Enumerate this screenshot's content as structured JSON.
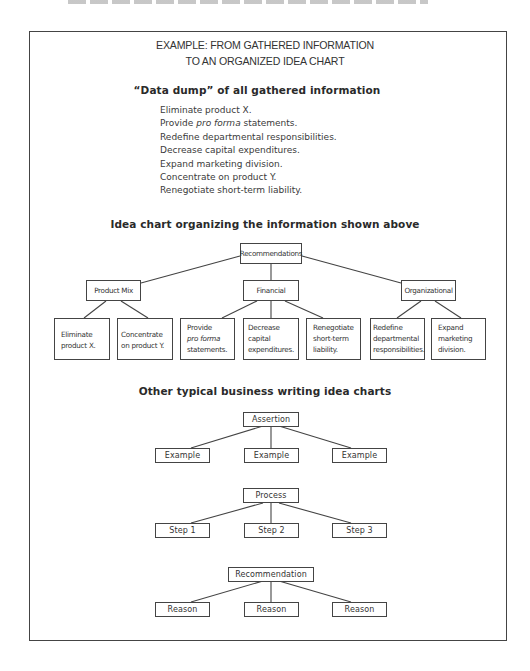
{
  "frame_title": {
    "line1": "EXAMPLE:  FROM GATHERED INFORMATION",
    "line2": "TO AN ORGANIZED IDEA CHART"
  },
  "data_dump": {
    "heading": "“Data dump” of all gathered information",
    "items": [
      {
        "pre": "Eliminate product X.",
        "italic": "",
        "post": ""
      },
      {
        "pre": "Provide ",
        "italic": "pro forma",
        "post": " statements."
      },
      {
        "pre": "Redefine departmental responsibilities.",
        "italic": "",
        "post": ""
      },
      {
        "pre": "Decrease capital expenditures.",
        "italic": "",
        "post": ""
      },
      {
        "pre": "Expand marketing division.",
        "italic": "",
        "post": ""
      },
      {
        "pre": "Concentrate on product Y.",
        "italic": "",
        "post": ""
      },
      {
        "pre": "Renegotiate short-term liability.",
        "italic": "",
        "post": ""
      }
    ]
  },
  "idea_chart": {
    "heading": "Idea chart organizing the information shown above",
    "root": "Recommendations",
    "branches": [
      {
        "label": "Product Mix",
        "leaves": [
          {
            "lines": [
              "Eliminate",
              "product X."
            ]
          },
          {
            "lines": [
              "Concentrate",
              "on product Y."
            ]
          }
        ]
      },
      {
        "label": "Financial",
        "leaves": [
          {
            "lines": [
              "Provide",
              "pro forma",
              "statements."
            ],
            "italic_line": 1
          },
          {
            "lines": [
              "Decrease",
              "capital",
              "expenditures."
            ]
          },
          {
            "lines": [
              "Renegotiate",
              "short-term",
              "liability."
            ]
          }
        ]
      },
      {
        "label": "Organizational",
        "leaves": [
          {
            "lines": [
              "Redefine",
              "departmental",
              "responsibilities."
            ]
          },
          {
            "lines": [
              "Expand",
              "marketing",
              "division."
            ]
          }
        ]
      }
    ]
  },
  "other_charts": {
    "heading": "Other typical business writing idea charts",
    "charts": [
      {
        "root": "Assertion",
        "children": [
          "Example",
          "Example",
          "Example"
        ]
      },
      {
        "root": "Process",
        "children": [
          "Step 1",
          "Step 2",
          "Step 3"
        ]
      },
      {
        "root": "Recommendation",
        "children": [
          "Reason",
          "Reason",
          "Reason"
        ]
      }
    ]
  }
}
